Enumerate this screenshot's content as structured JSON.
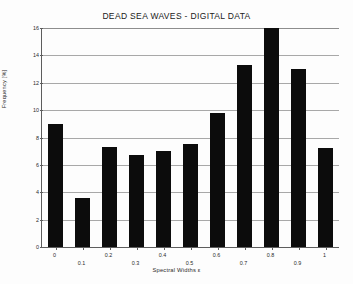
{
  "chart_data": {
    "type": "bar",
    "title": "DEAD SEA WAVES - DIGITAL DATA",
    "xlabel": "Spectral Widths  ε",
    "ylabel": "Frequency [%]",
    "categories": [
      "0",
      "0.1",
      "0.2",
      "0.3",
      "0.4",
      "0.5",
      "0.6",
      "0.7",
      "0.8",
      "0.9",
      "1"
    ],
    "values": [
      9.0,
      3.6,
      7.3,
      6.7,
      7.0,
      7.5,
      9.8,
      13.3,
      16.0,
      13.0,
      7.2
    ],
    "ylim": [
      0,
      16
    ],
    "yticks": [
      0,
      2,
      4,
      6,
      8,
      10,
      12,
      14,
      16
    ],
    "ytick_labels": [
      "0",
      "2",
      "4",
      "6",
      "8",
      "10",
      "12",
      "14",
      "16"
    ],
    "xlim": [
      -0.05,
      1.05
    ],
    "grid": "horizontal",
    "legend": "none",
    "bar_color": "#0c0c0c",
    "grid_color": "#a8a8a8",
    "axis_color": "#5d5d5d",
    "background": "#ffffff",
    "bar_width_fraction": 0.58,
    "tick_label_stagger": true
  }
}
